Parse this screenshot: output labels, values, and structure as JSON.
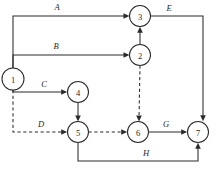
{
  "diagram": {
    "type": "activity-on-arrow-network",
    "title": "",
    "canvas": {
      "width": 217,
      "height": 174
    },
    "nodes": [
      {
        "id": "n1",
        "label": "1",
        "cx": 13,
        "cy": 79,
        "r": 11
      },
      {
        "id": "n2",
        "label": "2",
        "cx": 140,
        "cy": 55,
        "r": 10.5
      },
      {
        "id": "n3",
        "label": "3",
        "cx": 140,
        "cy": 16,
        "r": 10.5
      },
      {
        "id": "n4",
        "label": "4",
        "cx": 78,
        "cy": 92,
        "r": 10.5
      },
      {
        "id": "n5",
        "label": "5",
        "cx": 78,
        "cy": 132,
        "r": 10.5
      },
      {
        "id": "n6",
        "label": "6",
        "cx": 138,
        "cy": 132,
        "r": 10.5
      },
      {
        "id": "n7",
        "label": "7",
        "cx": 198,
        "cy": 132,
        "r": 10.5
      }
    ],
    "edges": [
      {
        "id": "eA",
        "label": "A",
        "from": "n1",
        "to": "n3",
        "style": "solid",
        "label_x": 57,
        "label_y": 10
      },
      {
        "id": "eB",
        "label": "B",
        "from": "n1",
        "to": "n2",
        "style": "solid",
        "label_x": 56,
        "label_y": 49
      },
      {
        "id": "eC",
        "label": "C",
        "from": "n1",
        "to": "n4",
        "style": "solid",
        "label_x": 44,
        "label_y": 87
      },
      {
        "id": "eD",
        "label": "D",
        "from": "n1",
        "to": "n5",
        "style": "dashed",
        "label_x": 41,
        "label_y": 127
      },
      {
        "id": "eE",
        "label": "E",
        "from": "n3",
        "to": "n7",
        "style": "solid",
        "label_x": 169,
        "label_y": 11
      },
      {
        "id": "eG",
        "label": "G",
        "from": "n6",
        "to": "n7",
        "style": "solid",
        "label_x": 166,
        "label_y": 127
      },
      {
        "id": "eH",
        "label": "H",
        "from": "n5",
        "to": "n7",
        "style": "solid",
        "label_x": 146,
        "label_y": 156
      },
      {
        "id": "e23",
        "label": "",
        "from": "n2",
        "to": "n3",
        "style": "solid",
        "label_x": null,
        "label_y": null
      },
      {
        "id": "e26",
        "label": "",
        "from": "n2",
        "to": "n6",
        "style": "dashed",
        "label_x": null,
        "label_y": null
      },
      {
        "id": "e45",
        "label": "",
        "from": "n4",
        "to": "n5",
        "style": "solid",
        "label_x": null,
        "label_y": null
      },
      {
        "id": "e56",
        "label": "",
        "from": "n5",
        "to": "n6",
        "style": "dashed",
        "label_x": null,
        "label_y": null
      }
    ],
    "edge_labels": {
      "A": "A",
      "B": "B",
      "C": "C",
      "D": "D",
      "E": "E",
      "G": "G",
      "H": "H"
    },
    "node_labels": {
      "one": "1",
      "two": "2",
      "three": "3",
      "four": "4",
      "five": "5",
      "six": "6",
      "seven": "7"
    },
    "colors": {
      "stroke": "#2b2b2b",
      "node_fill": "#ffffff",
      "text": "#1f1f1f",
      "background": "#ffffff"
    }
  }
}
